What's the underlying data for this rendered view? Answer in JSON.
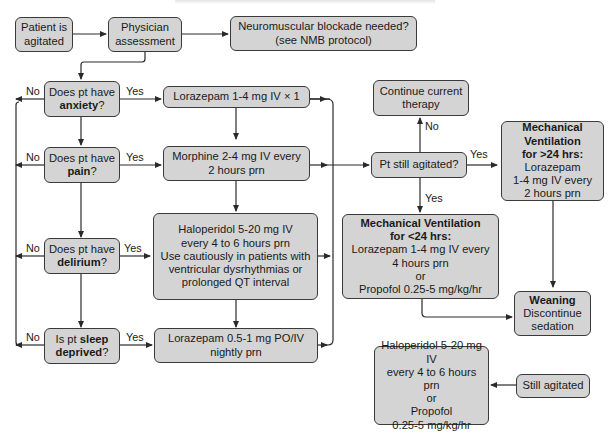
{
  "diagram": {
    "type": "flowchart",
    "header_text": "",
    "colors": {
      "box_fill": "#d4d4d4",
      "box_border": "#3a3a3a",
      "line": "#2a2a2a",
      "background": "#ffffff"
    },
    "nodes": {
      "start": {
        "lines": [
          "Patient is",
          "agitated"
        ]
      },
      "physician": {
        "lines": [
          "Physician",
          "assessment"
        ]
      },
      "nmb": {
        "lines": [
          "Neuromuscular blockade needed?",
          "(see NMB protocol)"
        ]
      },
      "q_anxiety": {
        "line1": "Does pt have",
        "bold": "anxiety",
        "suffix": "?"
      },
      "q_pain": {
        "line1": "Does pt have",
        "bold": "pain",
        "suffix": "?"
      },
      "q_delirium": {
        "line1": "Does pt have",
        "bold": "delirium",
        "suffix": "?"
      },
      "q_sleep": {
        "prefix": "Is pt ",
        "bold1": "sleep",
        "bold2": "deprived",
        "suffix": "?"
      },
      "t_anxiety": {
        "lines": [
          "Lorazepam 1-4 mg IV × 1"
        ]
      },
      "t_pain": {
        "lines": [
          "Morphine 2-4 mg IV every",
          "2 hours prn"
        ]
      },
      "t_delirium": {
        "lines": [
          "Haloperidol 5-20 mg IV",
          "every 4 to 6 hours prn",
          "Use cautiously in patients with",
          "ventricular dysrhythmias or",
          "prolonged QT interval"
        ]
      },
      "t_sleep": {
        "lines": [
          "Lorazepam 0.5-1 mg PO/IV",
          "nightly prn"
        ]
      },
      "continue": {
        "lines": [
          "Continue current",
          "therapy"
        ]
      },
      "still_agitated_q": {
        "lines": [
          "Pt still agitated?"
        ]
      },
      "mv_short": {
        "title1": "Mechanical Ventilation",
        "title2": "for <24 hrs:",
        "lines": [
          "Lorazepam 1-4 mg IV every",
          "4 hours prn",
          "or",
          "Propofol 0.25-5 mg/kg/hr"
        ]
      },
      "mv_long": {
        "title1": "Mechanical",
        "title2": "Ventilation",
        "title3": "for >24 hrs:",
        "lines": [
          "Lorazepam",
          "1-4 mg IV every",
          "2 hours prn"
        ]
      },
      "weaning": {
        "title": "Weaning",
        "lines": [
          "Discontinue",
          "sedation"
        ]
      },
      "rescue": {
        "lines": [
          "Haloperidol 5-20 mg IV",
          "every 4 to 6 hours prn",
          "or",
          "Propofol",
          "0.25-5 mg/kg/hr"
        ]
      },
      "still_agitated": {
        "lines": [
          "Still agitated"
        ]
      }
    },
    "edge_labels": {
      "anxiety_yes": "Yes",
      "anxiety_no": "No",
      "pain_yes": "Yes",
      "pain_no": "No",
      "delirium_yes": "Yes",
      "delirium_no": "No",
      "sleep_yes": "Yes",
      "sleep_no": "No",
      "still_no": "No",
      "still_yes_right": "Yes",
      "still_yes_down": "Yes"
    }
  }
}
